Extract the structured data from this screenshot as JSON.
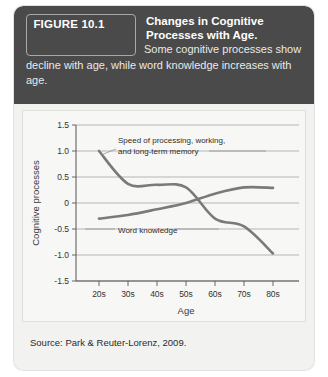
{
  "figure": {
    "number_label": "FIGURE 10.1",
    "title": "Changes in Cognitive Processes with Age.",
    "caption": "Some cognitive processes show decline with age, while word knowledge increases with age.",
    "source": "Source: Park & Reuter-Lorenz, 2009."
  },
  "colors": {
    "header_background": "#4a4a4a",
    "card_background": "#f2f2f0",
    "plot_background": "#f7f7f5",
    "curve": "#7a7a7a",
    "gridline": "#9a9a9a",
    "header_text": "#ffffff"
  },
  "chart_data": {
    "type": "line",
    "title": "",
    "xlabel": "Age",
    "ylabel": "Cognitive processes",
    "categories": [
      "20s",
      "30s",
      "40s",
      "50s",
      "60s",
      "70s",
      "80s"
    ],
    "x": [
      20,
      30,
      40,
      50,
      60,
      70,
      80
    ],
    "ylim": [
      -1.5,
      1.5
    ],
    "yticks": [
      "1.5",
      "1.0",
      "0.5",
      "0",
      "-0.5",
      "-1.0",
      "-1.5"
    ],
    "ytick_values": [
      1.5,
      1.0,
      0.5,
      0,
      -0.5,
      -1.0,
      -1.5
    ],
    "grid": true,
    "legend": "annotations",
    "series": [
      {
        "name": "Speed of processing, working, and long-term memory",
        "values": [
          1.0,
          0.37,
          0.35,
          0.3,
          -0.3,
          -0.45,
          -0.97
        ]
      },
      {
        "name": "Word knowledge",
        "values": [
          -0.3,
          -0.23,
          -0.12,
          0.0,
          0.18,
          0.3,
          0.29
        ]
      }
    ],
    "annotations": [
      {
        "id": "speed-annotation",
        "line1": "Speed of processing, working,",
        "line2": "and long-term memory"
      },
      {
        "id": "word-knowledge-annotation",
        "line1": "Word knowledge"
      }
    ]
  }
}
